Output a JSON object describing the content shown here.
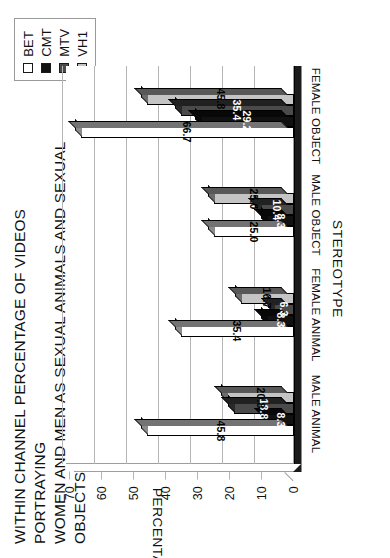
{
  "chart_data": {
    "type": "bar",
    "title": "WITHIN CHANNEL PERCENTAGE OF VIDEOS PORTRAYING\nWOMEN AND MEN AS SEXUAL ANIMALS AND SEXUAL OBJECTS",
    "orientation": "vertical-bars-rotated-page",
    "xlabel": "STEREOTYPE",
    "ylabel": "PERCENTAGE",
    "ylim": [
      0,
      70
    ],
    "ytick_step": 10,
    "yticks": [
      "0",
      "10",
      "20",
      "30",
      "40",
      "50",
      "60",
      "70"
    ],
    "grid": true,
    "legend_position": "top-right",
    "categories": [
      "MALE ANIMAL",
      "FEMALE ANIMAL",
      "MALE OBJECT",
      "FEMALE OBJECT"
    ],
    "series": [
      {
        "name": "BET",
        "color": "#ffffff",
        "values": [
          45.8,
          35.4,
          25.0,
          66.7
        ],
        "labels": [
          "45.8",
          "35.4",
          "25.0",
          "66.7"
        ]
      },
      {
        "name": "CMT",
        "color": "#111111",
        "values": [
          8.3,
          8.3,
          8.3,
          29.2
        ],
        "labels": [
          "8.3",
          "8.3",
          "8.3",
          "29.2"
        ]
      },
      {
        "name": "MTV",
        "color": "#4a4a4a",
        "values": [
          18.8,
          6.3,
          10.4,
          35.4
        ],
        "labels": [
          "18.8",
          "6.3",
          "10.4",
          "35.4"
        ]
      },
      {
        "name": "VH1",
        "color": "#c4c4c4",
        "values": [
          20.8,
          16.7,
          25.0,
          45.8
        ],
        "labels": [
          "20.8",
          "16.7",
          "25.0",
          "45.8"
        ]
      }
    ]
  },
  "legend": {
    "items": [
      {
        "label": "BET",
        "color": "#ffffff"
      },
      {
        "label": "CMT",
        "color": "#111111"
      },
      {
        "label": "MTV",
        "color": "#4a4a4a"
      },
      {
        "label": "VH1",
        "color": "#c4c4c4"
      }
    ]
  },
  "style": {
    "grid_color": "#b5b5b5",
    "axis_color": "#9d9d9d",
    "text_color": "#111111",
    "background": "#ffffff",
    "bar_outline": "#000000",
    "shelf_color": "#1b1b1b"
  }
}
